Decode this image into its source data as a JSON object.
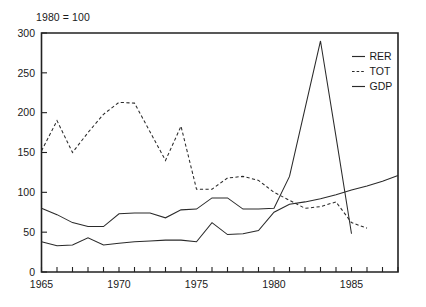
{
  "chart_data": {
    "type": "line",
    "title": "",
    "note": "1980 = 100",
    "xlabel": "",
    "ylabel": "",
    "xlim": [
      1965,
      1988
    ],
    "ylim": [
      0,
      300
    ],
    "yticks": [
      0,
      50,
      100,
      150,
      200,
      250,
      300
    ],
    "ytick_labels": [
      "0",
      "50",
      "100",
      "150",
      "200",
      "250",
      "300"
    ],
    "xticks": [
      1965,
      1966,
      1967,
      1968,
      1969,
      1970,
      1971,
      1972,
      1973,
      1974,
      1975,
      1976,
      1977,
      1978,
      1979,
      1980,
      1981,
      1982,
      1983,
      1984,
      1985,
      1986,
      1987,
      1988
    ],
    "xtick_labels": [
      "1965",
      "1970",
      "1975",
      "1980",
      "1985"
    ],
    "xtick_label_values": [
      1965,
      1970,
      1975,
      1980,
      1985
    ],
    "grid": false,
    "legend_position": "top-right",
    "series": [
      {
        "name": "RER",
        "style": "solid",
        "color": "#2a2a2a",
        "x": [
          1965,
          1966,
          1967,
          1968,
          1969,
          1970,
          1971,
          1972,
          1973,
          1974,
          1975,
          1976,
          1977,
          1978,
          1979,
          1980,
          1981,
          1982,
          1983,
          1984,
          1985
        ],
        "values": [
          80,
          72,
          62,
          57,
          57,
          73,
          74,
          74,
          68,
          78,
          79,
          93,
          93,
          79,
          79,
          80,
          120,
          205,
          290,
          170,
          48
        ]
      },
      {
        "name": "TOT",
        "style": "dashed",
        "color": "#2a2a2a",
        "x": [
          1965,
          1966,
          1967,
          1968,
          1969,
          1970,
          1971,
          1972,
          1973,
          1974,
          1975,
          1976,
          1977,
          1978,
          1979,
          1980,
          1981,
          1982,
          1983,
          1984,
          1985,
          1986
        ],
        "values": [
          152,
          190,
          150,
          175,
          198,
          213,
          212,
          176,
          140,
          183,
          104,
          104,
          118,
          120,
          115,
          100,
          90,
          80,
          82,
          88,
          62,
          55
        ]
      },
      {
        "name": "GDP",
        "style": "solid",
        "color": "#2a2a2a",
        "x": [
          1965,
          1966,
          1967,
          1968,
          1969,
          1970,
          1971,
          1972,
          1973,
          1974,
          1975,
          1976,
          1977,
          1978,
          1979,
          1980,
          1981,
          1982,
          1983,
          1984,
          1985,
          1986,
          1987,
          1988
        ],
        "values": [
          38,
          33,
          34,
          43,
          34,
          36,
          38,
          39,
          40,
          40,
          38,
          62,
          47,
          48,
          52,
          75,
          85,
          88,
          92,
          97,
          103,
          108,
          114,
          121
        ]
      }
    ]
  },
  "legend": {
    "items": [
      {
        "label": "RER",
        "style": "solid"
      },
      {
        "label": "TOT",
        "style": "dashed"
      },
      {
        "label": "GDP",
        "style": "solid"
      }
    ]
  },
  "axes": {
    "note_text": "1980 = 100"
  }
}
